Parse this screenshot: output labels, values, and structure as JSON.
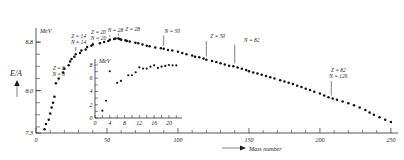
{
  "chart_data": {
    "type": "scatter",
    "title": "",
    "xlabel": "Mass number",
    "ylabel": "E/A",
    "yunit": "MeV",
    "xlim": [
      0,
      255
    ],
    "ylim": [
      7.3,
      9.0
    ],
    "grid": false,
    "legend_position": "none",
    "xticklabels": [
      "0",
      "50",
      "100",
      "150",
      "200",
      "250"
    ],
    "xtickvalues": [
      0,
      50,
      100,
      150,
      200,
      250
    ],
    "yticklabels": [
      "8.8",
      "8.0",
      "7.3"
    ],
    "ytickvalues": [
      8.8,
      8.0,
      7.3
    ],
    "arrow_label": "E/A",
    "x": [
      6,
      7,
      9,
      10,
      11,
      12,
      13,
      14,
      16,
      19,
      20,
      23,
      24,
      25,
      27,
      28,
      31,
      32,
      35,
      36,
      39,
      40,
      45,
      48,
      51,
      52,
      55,
      56,
      58,
      59,
      60,
      63,
      64,
      66,
      70,
      72,
      75,
      78,
      80,
      84,
      88,
      90,
      93,
      96,
      100,
      103,
      106,
      110,
      112,
      115,
      118,
      120,
      124,
      127,
      130,
      133,
      136,
      139,
      142,
      145,
      148,
      150,
      153,
      156,
      159,
      162,
      165,
      168,
      172,
      175,
      178,
      181,
      184,
      187,
      190,
      193,
      196,
      200,
      203,
      206,
      209,
      212,
      216,
      220,
      224,
      228,
      232,
      235,
      238,
      242,
      246,
      250
    ],
    "y": [
      7.36,
      7.45,
      7.52,
      7.62,
      7.72,
      7.8,
      7.9,
      8.12,
      8.2,
      8.3,
      8.36,
      8.42,
      8.48,
      8.52,
      8.56,
      8.6,
      8.62,
      8.66,
      8.68,
      8.72,
      8.74,
      8.76,
      8.78,
      8.8,
      8.82,
      8.84,
      8.85,
      8.86,
      8.86,
      8.85,
      8.84,
      8.83,
      8.82,
      8.81,
      8.79,
      8.78,
      8.76,
      8.74,
      8.73,
      8.71,
      8.7,
      8.69,
      8.67,
      8.66,
      8.64,
      8.62,
      8.6,
      8.58,
      8.56,
      8.55,
      8.53,
      8.51,
      8.49,
      8.47,
      8.45,
      8.43,
      8.41,
      8.4,
      8.38,
      8.36,
      8.34,
      8.32,
      8.3,
      8.28,
      8.26,
      8.24,
      8.22,
      8.2,
      8.17,
      8.15,
      8.13,
      8.11,
      8.08,
      8.06,
      8.03,
      8.01,
      7.98,
      7.95,
      7.92,
      7.89,
      7.87,
      7.85,
      7.82,
      7.79,
      7.76,
      7.72,
      7.68,
      7.64,
      7.6,
      7.56,
      7.52,
      7.48
    ],
    "annotations": [
      {
        "text_top": "Z = 8",
        "text_bottom": "N = 8",
        "x": 16,
        "label_x": 16,
        "label_y": 8.34
      },
      {
        "text_top": "Z = 14",
        "text_bottom": "N = 14",
        "x": 28,
        "label_x": 30,
        "label_y": 8.86
      },
      {
        "text_top": "Z = 20",
        "text_bottom": "N = 20",
        "x": 40,
        "label_x": 44,
        "label_y": 8.94
      },
      {
        "text_top": "N = 28",
        "text_bottom": "",
        "x": 52,
        "label_x": 56,
        "label_y": 8.96
      },
      {
        "text_top": "Z = 28",
        "text_bottom": "",
        "x": 58,
        "label_x": 68,
        "label_y": 8.98
      },
      {
        "text_top": "N = 50",
        "text_bottom": "",
        "x": 90,
        "label_x": 96,
        "label_y": 8.95
      },
      {
        "text_top": "Z = 50",
        "text_bottom": "",
        "x": 120,
        "label_x": 128,
        "label_y": 8.86
      },
      {
        "text_top": "N = 82",
        "text_bottom": "",
        "x": 140,
        "label_x": 152,
        "label_y": 8.8
      },
      {
        "text_top": "Z = 82",
        "text_bottom": "N = 126",
        "x": 208,
        "label_x": 213,
        "label_y": 8.3
      }
    ]
  },
  "inset_chart_data": {
    "type": "scatter",
    "xlabel": "",
    "ylabel": "",
    "yunit": "MeV",
    "xlim": [
      0,
      23
    ],
    "ylim": [
      0,
      8.6
    ],
    "grid": false,
    "xticklabels": [
      "0",
      "4",
      "8",
      "12",
      "16",
      "20"
    ],
    "xtickvalues": [
      0,
      4,
      8,
      12,
      16,
      20
    ],
    "yticklabels": [
      "0",
      "2",
      "4",
      "6",
      "8"
    ],
    "ytickvalues": [
      0,
      2,
      4,
      6,
      8
    ],
    "x": [
      2,
      3,
      4,
      6,
      7,
      9,
      10,
      11,
      12,
      13,
      14,
      15,
      16,
      17,
      18,
      19,
      20,
      21,
      22
    ],
    "y": [
      1.1,
      2.6,
      7.05,
      5.3,
      5.6,
      6.45,
      6.45,
      6.9,
      7.65,
      7.45,
      7.45,
      7.75,
      7.95,
      7.55,
      7.75,
      7.85,
      8.0,
      7.95,
      7.95
    ]
  }
}
